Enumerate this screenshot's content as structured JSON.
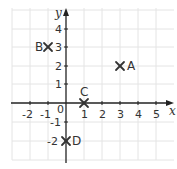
{
  "diagram": {
    "type": "coordinate-grid",
    "axes": {
      "x_label": "x",
      "y_label": "y",
      "origin_label": "0",
      "x_ticks": [
        "-2",
        "-1",
        "1",
        "2",
        "3",
        "4",
        "5"
      ],
      "y_ticks": [
        "4",
        "3",
        "2",
        "1",
        "-1",
        "-2"
      ],
      "x_range": [
        -3,
        5.5
      ],
      "y_range": [
        -3,
        5
      ]
    },
    "points": [
      {
        "label": "A",
        "x": 3,
        "y": 2
      },
      {
        "label": "B",
        "x": -1,
        "y": 3
      },
      {
        "label": "C",
        "x": 1,
        "y": 0
      },
      {
        "label": "D",
        "x": 0,
        "y": -2
      }
    ],
    "colors": {
      "grid": "#e4e4e4",
      "axis": "#222222",
      "text": "#333333"
    }
  }
}
